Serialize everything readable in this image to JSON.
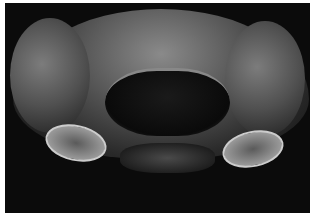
{
  "image": {
    "subject": "scanning electron micrograph of an insect head, frontal view",
    "style": "grayscale",
    "border_color": "#ffffff",
    "background_color": "#0b0b0b"
  }
}
